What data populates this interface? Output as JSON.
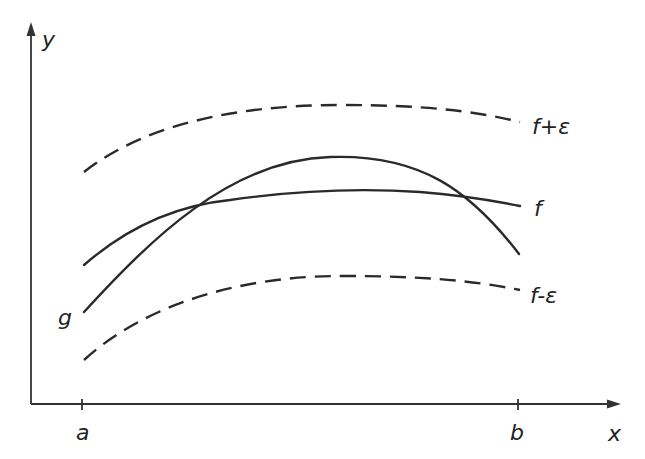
{
  "diagram": {
    "type": "function-approximation",
    "axes": {
      "x_label": "x",
      "y_label": "y",
      "x_ticks": [
        {
          "label": "a"
        },
        {
          "label": "b"
        }
      ]
    },
    "curves": [
      {
        "id": "f_plus_eps",
        "label": "f+ε",
        "style": "dashed"
      },
      {
        "id": "f",
        "label": "f",
        "style": "solid"
      },
      {
        "id": "g",
        "label": "g",
        "style": "solid"
      },
      {
        "id": "f_minus_eps",
        "label": "f-ε",
        "style": "dashed"
      }
    ],
    "colors": {
      "stroke": "#2a2a2a",
      "background": "#ffffff"
    }
  }
}
